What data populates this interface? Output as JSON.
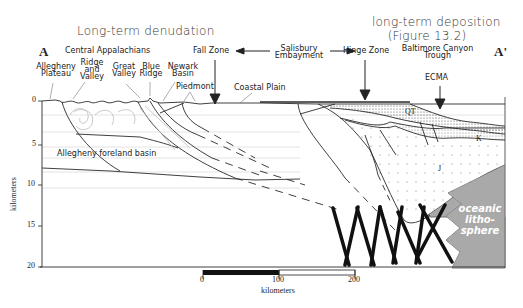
{
  "headings": {
    "left": "Long-term denudation",
    "right_line1": "long-term deposition",
    "right_line2": "(Figure 13.2)"
  },
  "section_endpoints": {
    "start": "A",
    "end": "A'"
  },
  "region_labels": {
    "central_appalachians": "Central Appalachians",
    "allegheny_plateau": [
      "Allegheny",
      "Plateau"
    ],
    "ridge_and_valley": [
      "Ridge",
      "and",
      "Valley"
    ],
    "great_valley": [
      "Great",
      "Valley"
    ],
    "blue_ridge": [
      "Blue",
      "Ridge"
    ],
    "newark_basin": [
      "Newark",
      "Basin"
    ],
    "piedmont": "Piedmont",
    "coastal_plain": "Coastal Plain",
    "fall_zone": "Fall Zone",
    "salisbury_embayment": [
      "Salisbury",
      "Embayment"
    ],
    "hinge_zone": "Hinge Zone",
    "baltimore_canyon_trough": [
      "Baltimore Canyon",
      "Trough"
    ],
    "ecma": "ECMA",
    "allegheny_foreland_basin": "Allegheny foreland basin",
    "oceanic_lithosphere": [
      "oceanic",
      "litho-",
      "sphere"
    ]
  },
  "unit_labels": {
    "qt": "QT",
    "k": "K",
    "j": "J"
  },
  "depth_axis": {
    "label": "kilometers",
    "ticks": [
      "0",
      "5",
      "10",
      "15",
      "20"
    ]
  },
  "scale_bar": {
    "ticks": [
      "0",
      "100",
      "200"
    ],
    "label": "kilometers"
  },
  "colors": {
    "line": "#2a2a2a",
    "oceanic_fill": "#a9a9a9",
    "dots": "#777777",
    "faint": "#bdbdbd"
  }
}
